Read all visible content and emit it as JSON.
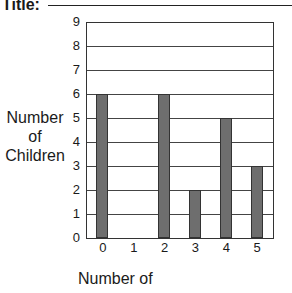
{
  "header": {
    "title_label": "Title:"
  },
  "chart_data": {
    "type": "bar",
    "title": "",
    "title_label": "Title:",
    "xlabel": "Number of",
    "ylabel": "Number of Children",
    "ylabel_lines": [
      "Number",
      "of",
      "Children"
    ],
    "categories": [
      "0",
      "1",
      "2",
      "3",
      "4",
      "5"
    ],
    "values": [
      6,
      0,
      6,
      2,
      5,
      3
    ],
    "ylim": [
      0,
      9
    ],
    "yticks": [
      "0",
      "1",
      "2",
      "3",
      "4",
      "5",
      "6",
      "7",
      "8",
      "9"
    ],
    "grid": true,
    "bar_color": "#6e6e6e",
    "legend": null
  }
}
